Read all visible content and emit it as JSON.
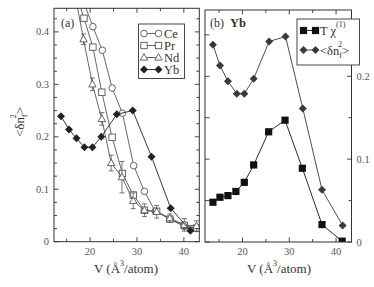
{
  "figure": {
    "panels": [
      "(a)",
      "(b)"
    ]
  },
  "chart_data": [
    {
      "panel": "a",
      "type": "line",
      "tag": "(a)",
      "title": "",
      "xlabel": {
        "pre": "V (Å",
        "sup": "3",
        "post": "/atom)"
      },
      "ylabel": {
        "pre": "<δn",
        "sub": "f",
        "sup": "2",
        "post": ">"
      },
      "xlim": [
        12.3,
        43.3
      ],
      "ylim": [
        0,
        0.445
      ],
      "grid": false,
      "legend_position": "upper right",
      "xticks": {
        "major": [
          20,
          30,
          40
        ],
        "minor": [
          15,
          25,
          35
        ],
        "labels": [
          "20",
          "30",
          "40"
        ]
      },
      "yticks_left": {
        "major": [
          0,
          0.1,
          0.2,
          0.3,
          0.4
        ],
        "labels": [
          "0",
          "0.1",
          "0.2",
          "0.3",
          "0.4"
        ],
        "minor": [
          0.025,
          0.05,
          0.075,
          0.125,
          0.15,
          0.175,
          0.225,
          0.25,
          0.275,
          0.325,
          0.35,
          0.375,
          0.425
        ]
      },
      "yticks_right": {
        "major": [
          0,
          0.1,
          0.2,
          0.3,
          0.4
        ],
        "labels": [],
        "minor": [
          0.025,
          0.05,
          0.075,
          0.125,
          0.15,
          0.175,
          0.225,
          0.25,
          0.275,
          0.325,
          0.35,
          0.375,
          0.425
        ]
      },
      "legend": [
        {
          "label": "Ce",
          "series": 0
        },
        {
          "label": "Pr",
          "series": 1
        },
        {
          "label": "Nd",
          "series": 2
        },
        {
          "label": "Yb",
          "series": 3
        }
      ],
      "series": [
        {
          "name": "Ce",
          "marker": "open-circle",
          "color": "#555555",
          "x": [
            18.5,
            20.6,
            22.6,
            24.7,
            26.9,
            29.3,
            31.6,
            33.9,
            37.1,
            40.1,
            42.7
          ],
          "y": [
            0.46,
            0.41,
            0.365,
            0.293,
            0.245,
            0.145,
            0.096,
            0.058,
            0.043,
            0.029,
            0.025
          ]
        },
        {
          "name": "Pr",
          "marker": "open-square",
          "color": "#555555",
          "x": [
            16.8,
            18.7,
            20.6,
            22.5,
            24.7,
            26.9,
            29.2,
            31.6,
            34.2,
            37.0,
            40.1,
            42.7
          ],
          "y": [
            0.48,
            0.426,
            0.371,
            0.285,
            0.199,
            0.13,
            0.089,
            0.06,
            0.058,
            0.043,
            0.031,
            0.026
          ]
        },
        {
          "name": "Nd",
          "marker": "open-triangle",
          "color": "#555555",
          "x": [
            16.8,
            18.6,
            20.5,
            22.5,
            24.5,
            26.8,
            29.2,
            31.6,
            34.2,
            37.0,
            40.1,
            42.7
          ],
          "y": [
            0.47,
            0.386,
            0.3,
            0.234,
            0.15,
            0.123,
            0.078,
            0.06,
            0.057,
            0.045,
            0.032,
            0.03
          ],
          "yerr": [
            0,
            0.01,
            0.012,
            0.012,
            0.015,
            0.03,
            0.015,
            0.012,
            0.012,
            0.008,
            0.012,
            0.01
          ]
        },
        {
          "name": "Yb",
          "marker": "filled-diamond",
          "color": "#222222",
          "x": [
            13.8,
            15.5,
            17.1,
            18.8,
            20.5,
            22.4,
            25.7,
            29.1,
            33.1,
            37.2,
            41.4
          ],
          "y": [
            0.239,
            0.214,
            0.197,
            0.18,
            0.18,
            0.2,
            0.243,
            0.25,
            0.162,
            0.064,
            0.021
          ]
        }
      ]
    },
    {
      "panel": "b",
      "type": "line",
      "tag": "(b)",
      "title": "Yb",
      "xlabel": {
        "pre": "V (Å",
        "sup": "3",
        "post": "/atom)"
      },
      "ylabel": "",
      "xlim": [
        12.0,
        43.3
      ],
      "ylim": [
        0,
        0.28
      ],
      "grid": false,
      "legend_position": "upper right",
      "xticks": {
        "major": [
          20,
          30,
          40
        ],
        "minor": [
          15,
          25,
          35
        ],
        "labels": [
          "20",
          "30",
          "40"
        ]
      },
      "yticks_left": {
        "major": [
          0,
          0.05,
          0.1,
          0.15,
          0.2,
          0.25
        ],
        "labels": [],
        "minor": []
      },
      "yticks_right": {
        "major": [
          0,
          0.1,
          0.2
        ],
        "labels": [
          "0",
          "0.1",
          "0.2"
        ],
        "minor": [
          0.05,
          0.15,
          0.25
        ]
      },
      "legend": [
        {
          "label": "T χ",
          "sup": "(1)",
          "series": 0
        },
        {
          "label_parts": {
            "pre": "<δn",
            "sub": "f",
            "sup": "2",
            "post": ">"
          },
          "series": 1
        }
      ],
      "series": [
        {
          "name": "T χ(1)",
          "marker": "filled-square",
          "color": "#111111",
          "x": [
            13.7,
            15.2,
            16.9,
            18.6,
            20.4,
            22.4,
            25.6,
            29.1,
            32.8,
            37.0,
            41.3
          ],
          "y": [
            0.048,
            0.054,
            0.056,
            0.061,
            0.072,
            0.093,
            0.133,
            0.147,
            0.089,
            0.021,
            0.001
          ]
        },
        {
          "name": "<δn_f^2>",
          "marker": "filled-diamond",
          "color": "#3a3a3a",
          "x": [
            13.7,
            15.2,
            16.9,
            18.8,
            20.4,
            22.4,
            25.7,
            29.2,
            32.9,
            37.0,
            41.4
          ],
          "y": [
            0.238,
            0.213,
            0.194,
            0.179,
            0.179,
            0.197,
            0.242,
            0.248,
            0.161,
            0.063,
            0.02
          ]
        }
      ]
    }
  ]
}
